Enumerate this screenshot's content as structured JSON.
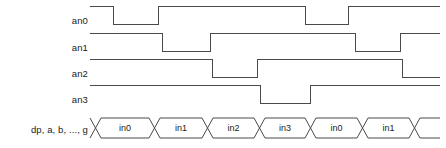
{
  "diagram": {
    "type": "timing-diagram",
    "title": "",
    "background_color": "#ffffff",
    "line_color": "#4a4a4a",
    "text_color": "#222222",
    "width": 446,
    "height": 148,
    "wave_start_x": 90,
    "wave_end_x": 440,
    "signals": [
      {
        "name": "an0",
        "label": "an0",
        "label_x": 88,
        "label_y": 20,
        "high_y": 6,
        "low_y": 24,
        "initial_level": "high",
        "transitions": [
          {
            "x": 113,
            "to": "low"
          },
          {
            "x": 158,
            "to": "high"
          },
          {
            "x": 305,
            "to": "low"
          },
          {
            "x": 348,
            "to": "high"
          }
        ]
      },
      {
        "name": "an1",
        "label": "an1",
        "label_x": 88,
        "label_y": 47,
        "high_y": 33,
        "low_y": 51,
        "initial_level": "high",
        "transitions": [
          {
            "x": 162,
            "to": "low"
          },
          {
            "x": 210,
            "to": "high"
          },
          {
            "x": 355,
            "to": "low"
          },
          {
            "x": 400,
            "to": "high"
          }
        ]
      },
      {
        "name": "an2",
        "label": "an2",
        "label_x": 88,
        "label_y": 73,
        "high_y": 59,
        "low_y": 77,
        "initial_level": "high",
        "transitions": [
          {
            "x": 212,
            "to": "low"
          },
          {
            "x": 257,
            "to": "high"
          },
          {
            "x": 402,
            "to": "low"
          }
        ]
      },
      {
        "name": "an3",
        "label": "an3",
        "label_x": 88,
        "label_y": 99,
        "high_y": 85,
        "low_y": 103,
        "initial_level": "high",
        "transitions": [
          {
            "x": 260,
            "to": "low"
          },
          {
            "x": 310,
            "to": "high"
          }
        ]
      }
    ],
    "bus": {
      "name": "dp, a, b, ..., g",
      "label": "dp, a, b, ..., g",
      "label_x": 88,
      "label_y": 130,
      "top_y": 118,
      "bottom_y": 138,
      "start_x": 90,
      "end_x": 440,
      "transition_width": 11,
      "segments": [
        {
          "value": "in0",
          "start_x": 101,
          "end_x": 160
        },
        {
          "value": "in1",
          "start_x": 160,
          "end_x": 213
        },
        {
          "value": "in2",
          "start_x": 213,
          "end_x": 265
        },
        {
          "value": "in3",
          "start_x": 265,
          "end_x": 316
        },
        {
          "value": "in0",
          "start_x": 316,
          "end_x": 368
        },
        {
          "value": "in1",
          "start_x": 368,
          "end_x": 420
        }
      ]
    }
  }
}
